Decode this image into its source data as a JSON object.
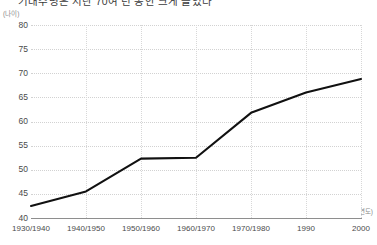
{
  "title": "기대수명은 지난 70여 년 동안 크게 늘었다",
  "y_unit_caption": "(나이)",
  "x_unit_caption": "(연도)",
  "accent_color": "#111111",
  "grid_color": "#d2d2d2",
  "axis_color": "#8e8e8e",
  "background_color": "#ffffff",
  "chart_data": {
    "type": "line",
    "title": "기대수명은 지난 70여 년 동안 크게 늘었다",
    "xlabel": "(연도)",
    "ylabel": "(나이)",
    "grid": true,
    "legend": false,
    "ylim": [
      40,
      80
    ],
    "ytick_step": 5,
    "yticks": [
      40,
      45,
      50,
      55,
      60,
      65,
      70,
      75,
      80
    ],
    "categories": [
      "1930/1940",
      "1940/1950",
      "1950/1960",
      "1960/1970",
      "1970/1980",
      "1990",
      "2000"
    ],
    "series": [
      {
        "name": "기대수명",
        "color": "#111111",
        "values": [
          42.5,
          45.5,
          52.3,
          52.5,
          61.8,
          66.0,
          68.8
        ]
      }
    ]
  }
}
